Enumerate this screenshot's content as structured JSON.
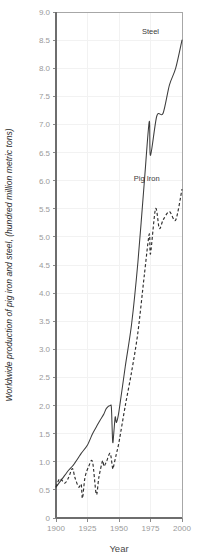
{
  "chart_data": {
    "type": "line",
    "title": "",
    "xlabel": "Year",
    "ylabel": "Worldwide production of pig iron and steel, (hundred million metric tons)",
    "xlim": [
      1900,
      2000
    ],
    "ylim": [
      0,
      9.0
    ],
    "grid": true,
    "legend_position": "inline-labels",
    "xticks": [
      1900,
      1925,
      1950,
      1975,
      2000
    ],
    "xtick_labels": [
      "1900",
      "1925",
      "1950",
      "1975",
      "2000"
    ],
    "yticks": [
      0,
      0.5,
      1.0,
      1.5,
      2.0,
      2.5,
      3.0,
      3.5,
      4.0,
      4.5,
      5.0,
      5.5,
      6.0,
      6.5,
      7.0,
      7.5,
      8.0,
      8.5,
      9.0
    ],
    "ytick_labels": [
      "0",
      "0.5",
      "1.0",
      "1.5",
      "2.0",
      "2.5",
      "3.0",
      "3.5",
      "4.0",
      "4.5",
      "5.0",
      "5.5",
      "6.0",
      "6.5",
      "7.0",
      "7.5",
      "8.0",
      "8.5",
      "9.0"
    ],
    "series": [
      {
        "name": "Steel",
        "style": "solid",
        "color": "#3c3c3c",
        "label_x": 1975,
        "label_y": 8.6,
        "x": [
          1900,
          1905,
          1910,
          1913,
          1915,
          1918,
          1920,
          1925,
          1929,
          1932,
          1935,
          1938,
          1940,
          1943,
          1944,
          1945,
          1946,
          1947,
          1948,
          1950,
          1955,
          1960,
          1965,
          1970,
          1974,
          1975,
          1980,
          1985,
          1990,
          1995,
          2000
        ],
        "y": [
          0.55,
          0.7,
          0.85,
          0.92,
          0.98,
          1.08,
          1.15,
          1.3,
          1.5,
          1.62,
          1.74,
          1.85,
          1.95,
          2.0,
          1.95,
          1.35,
          1.55,
          1.8,
          1.7,
          1.9,
          2.7,
          3.45,
          4.55,
          5.95,
          7.05,
          6.45,
          7.15,
          7.2,
          7.7,
          8.0,
          8.5
        ],
        "annotations": [
          {
            "text": "Steel",
            "x": 1975,
            "y": 8.6
          }
        ]
      },
      {
        "name": "Pig Iron",
        "style": "dashed",
        "color": "#2e2e2e",
        "label_x": 1972,
        "label_y": 6.0,
        "x": [
          1900,
          1903,
          1907,
          1910,
          1913,
          1915,
          1918,
          1920,
          1921,
          1923,
          1926,
          1929,
          1932,
          1934,
          1937,
          1938,
          1940,
          1943,
          1945,
          1946,
          1948,
          1950,
          1955,
          1960,
          1965,
          1970,
          1974,
          1975,
          1979,
          1982,
          1985,
          1990,
          1995,
          2000
        ],
        "y": [
          0.55,
          0.7,
          0.62,
          0.72,
          0.88,
          0.72,
          0.55,
          0.6,
          0.35,
          0.72,
          0.92,
          1.0,
          0.42,
          0.72,
          1.02,
          0.92,
          1.0,
          1.15,
          0.88,
          0.95,
          1.15,
          1.35,
          2.0,
          2.6,
          3.3,
          4.3,
          5.05,
          4.7,
          5.5,
          5.15,
          5.3,
          5.45,
          5.3,
          5.85
        ],
        "annotations": [
          {
            "text": "Pig Iron",
            "x": 1972,
            "y": 6.0
          }
        ]
      }
    ]
  },
  "axes": {
    "x_title": "Year",
    "y_title": "Worldwide production of pig iron and steel, (hundred million metric tons)"
  },
  "labels": {
    "steel": "Steel",
    "pig_iron": "Pig Iron"
  },
  "colors": {
    "background": "#ffffff",
    "grid": "#f2f2f2",
    "axis": "#6e6e6e",
    "tick_text": "#9a9a9a",
    "steel_line": "#3c3c3c",
    "pig_iron_line": "#2e2e2e"
  }
}
